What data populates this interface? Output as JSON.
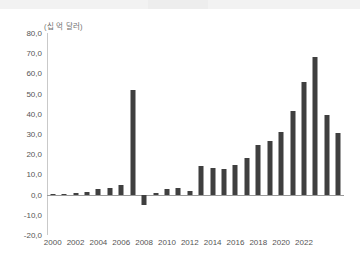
{
  "page": {
    "background_color": "#ffffff",
    "top_strip_color": "#f2f2f2"
  },
  "chart_data": {
    "type": "bar",
    "title": "",
    "subtitle": "",
    "unit_label": "(십 억 달러)",
    "xlabel": "",
    "ylabel": "",
    "bar_color": "#3f3f3f",
    "grid": false,
    "legend": null,
    "legend_position": "none",
    "ylim": [
      -20.0,
      80.0
    ],
    "ytick_step": 10.0,
    "ytick_labels": [
      "80,0",
      "70,0",
      "60,0",
      "50,0",
      "40,0",
      "30,0",
      "20,0",
      "10,0",
      "0,0",
      "-10,0",
      "-20,0"
    ],
    "ytick_values": [
      80.0,
      70.0,
      60.0,
      50.0,
      40.0,
      30.0,
      20.0,
      10.0,
      0.0,
      -10.0,
      -20.0
    ],
    "xtick_labels": [
      "2000",
      "2002",
      "2004",
      "2006",
      "2008",
      "2010",
      "2012",
      "2014",
      "2016",
      "2018",
      "2020",
      "2022"
    ],
    "xtick_values": [
      2000,
      2002,
      2004,
      2006,
      2008,
      2010,
      2012,
      2014,
      2016,
      2018,
      2020,
      2022
    ],
    "categories": [
      "2000",
      "2001",
      "2002",
      "2003",
      "2004",
      "2005",
      "2006",
      "2007",
      "2008",
      "2009",
      "2010",
      "2011",
      "2012",
      "2013",
      "2014",
      "2015",
      "2016",
      "2017",
      "2018",
      "2019",
      "2020",
      "2021",
      "2022",
      "2023"
    ],
    "values": [
      0.4,
      0.5,
      0.8,
      1.2,
      2.6,
      3.4,
      4.6,
      52.0,
      -5.0,
      0.6,
      2.8,
      3.4,
      1.6,
      14.0,
      13.0,
      12.6,
      14.6,
      18.0,
      24.5,
      26.5,
      31.0,
      41.5,
      55.5,
      68.0
    ],
    "values_tail": [
      39.5,
      30.5
    ],
    "categories_tail": [
      "2024",
      "2025"
    ]
  }
}
